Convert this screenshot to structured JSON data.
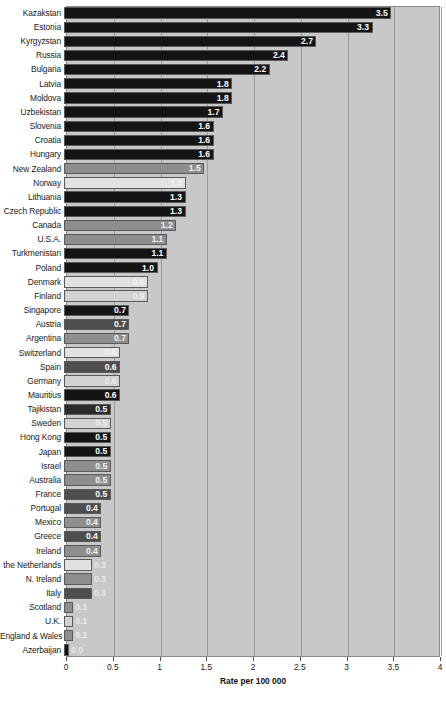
{
  "chart_data": {
    "type": "bar",
    "orientation": "horizontal",
    "title": "",
    "xlabel": "Rate per 100 000",
    "ylabel": "",
    "xlim": [
      0,
      4
    ],
    "xticks": [
      0,
      0.5,
      1,
      1.5,
      2,
      2.5,
      3,
      3.5,
      4
    ],
    "xtick_labels": [
      "0",
      "0.5",
      "1",
      "1.5",
      "2",
      "2.5",
      "3",
      "3.5",
      "4"
    ],
    "grid": true,
    "legend": "none",
    "categories": [
      "Kazakstan",
      "Estonia",
      "Kyrgyzstan",
      "Russia",
      "Bulgaria",
      "Latvia",
      "Moldova",
      "Uzbekistan",
      "Slovenia",
      "Croatia",
      "Hungary",
      "New Zealand",
      "Norway",
      "Lithuania",
      "Czech Republic",
      "Canada",
      "U.S.A.",
      "Turkmenistan",
      "Poland",
      "Denmark",
      "Finland",
      "Singapore",
      "Austria",
      "Argentina",
      "Switzerland",
      "Spain",
      "Germany",
      "Mauritius",
      "Tajikistan",
      "Sweden",
      "Hong Kong",
      "Japan",
      "Israel",
      "Australia",
      "France",
      "Portugal",
      "Mexico",
      "Greece",
      "Ireland",
      "the Netherlands",
      "N. Ireland",
      "Italy",
      "Scotland",
      "U.K.",
      "England & Wales",
      "Azerbaijan"
    ],
    "values": [
      3.5,
      3.3,
      2.7,
      2.4,
      2.2,
      1.8,
      1.8,
      1.7,
      1.6,
      1.6,
      1.6,
      1.5,
      1.3,
      1.3,
      1.3,
      1.2,
      1.1,
      1.1,
      1.0,
      0.9,
      0.9,
      0.7,
      0.7,
      0.7,
      0.6,
      0.6,
      0.6,
      0.6,
      0.5,
      0.5,
      0.5,
      0.5,
      0.5,
      0.5,
      0.5,
      0.4,
      0.4,
      0.4,
      0.4,
      0.3,
      0.3,
      0.3,
      0.1,
      0.1,
      0.1,
      0.0
    ],
    "value_labels": [
      "3.5",
      "3.3",
      "2.7",
      "2.4",
      "2.2",
      "1.8",
      "1.8",
      "1.7",
      "1.6",
      "1.6",
      "1.6",
      "1.5",
      "1.3",
      "1.3",
      "1.3",
      "1.2",
      "1.1",
      "1.1",
      "1.0",
      "0.9",
      "0.9",
      "0.7",
      "0.7",
      "0.7",
      "0.6",
      "0.6",
      "0.6",
      "0.6",
      "0.5",
      "0.5",
      "0.5",
      "0.5",
      "0.5",
      "0.5",
      "0.5",
      "0.4",
      "0.4",
      "0.4",
      "0.4",
      "0.3",
      "0.3",
      "0.3",
      "0.1",
      "0.1",
      "0.1",
      "0.0"
    ],
    "bar_shades": [
      "vdark",
      "vdark",
      "vdark",
      "vdark",
      "vdark",
      "vdark",
      "vdark",
      "vdark",
      "vdark",
      "vdark",
      "vdark",
      "mid",
      "vlight",
      "vdark",
      "vdark",
      "mid",
      "mid",
      "vdark",
      "vdark",
      "vlight",
      "light",
      "vdark",
      "mdark",
      "mid",
      "vlight",
      "mdark",
      "light",
      "vdark",
      "dark",
      "light",
      "vdark",
      "vdark",
      "mid",
      "mid",
      "mdark",
      "mdark",
      "mid",
      "mdark",
      "mid",
      "vlight",
      "mid",
      "mdark",
      "mid",
      "light",
      "mid",
      "vdark"
    ],
    "colors": {
      "plot_background": "#c8c8c8",
      "page_background": "#ffffff",
      "gridline": "#9a9a9a",
      "axis": "#4a4a4a",
      "text": "#1a1a1a"
    }
  }
}
